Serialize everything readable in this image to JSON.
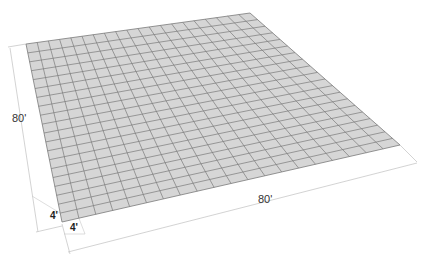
{
  "diagram": {
    "type": "perspective-grid",
    "grid": {
      "cells_x": 20,
      "cells_y": 20,
      "fill_color": "#d6d6d6",
      "line_color": "#7a7a7a",
      "corners": {
        "top_left": [
          26,
          44
        ],
        "top_right": [
          250,
          13
        ],
        "bottom_right": [
          400,
          145
        ],
        "bottom_left": [
          62,
          222
        ]
      }
    },
    "dimension_color": "#c8c8c8",
    "dimensions": {
      "left_total": {
        "label": "80'",
        "position": [
          12,
          112
        ]
      },
      "left_cell": {
        "label": "4'",
        "position": [
          50,
          210
        ]
      },
      "bottom_total": {
        "label": "80'",
        "position": [
          258,
          193
        ]
      },
      "bottom_cell": {
        "label": "4'",
        "position": [
          70,
          222
        ]
      }
    }
  }
}
